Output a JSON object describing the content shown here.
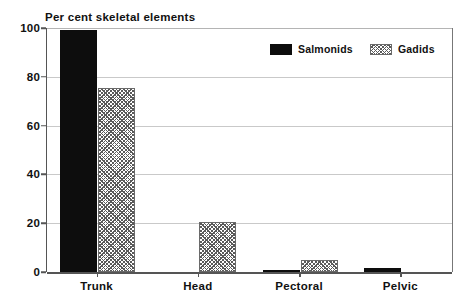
{
  "chart_data": {
    "type": "bar",
    "title": "Per cent skeletal elements",
    "xlabel": "",
    "ylabel": "",
    "ylim": [
      0,
      100
    ],
    "yticks": [
      0,
      20,
      40,
      60,
      80,
      100
    ],
    "ytick_labels": [
      "0",
      "20",
      "40",
      "60",
      "80",
      "100"
    ],
    "categories": [
      "Trunk",
      "Head",
      "Pectoral",
      "Pelvic"
    ],
    "series": [
      {
        "name": "Salmonids",
        "color": "#0d0d0d",
        "fill": "solid",
        "values": [
          99,
          0,
          0.7,
          1.5
        ]
      },
      {
        "name": "Gadids",
        "color": "#5a5a5a",
        "fill": "hatched",
        "values": [
          75.5,
          20.5,
          5,
          0
        ]
      }
    ],
    "grid": true,
    "grid_axis": "y",
    "legend_position": "top-right"
  }
}
